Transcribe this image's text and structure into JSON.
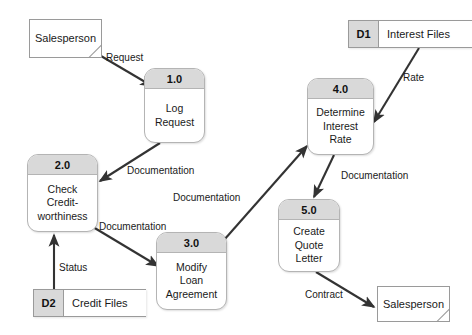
{
  "diagram": {
    "type": "data-flow-diagram",
    "notation": "Gane-Sarson",
    "colors": {
      "background": "#ffffff",
      "shape_fill": "#ffffff",
      "header_fill": "#d9d9d9",
      "stroke": "#9a9a9a",
      "arrow": "#333333",
      "text": "#1a1a1a"
    },
    "entities": [
      {
        "id": "salesperson-source",
        "label": "Salesperson"
      },
      {
        "id": "salesperson-sink",
        "label": "Salesperson"
      }
    ],
    "processes": [
      {
        "id": "process-1",
        "number": "1.0",
        "lines": [
          "Log",
          "Request"
        ]
      },
      {
        "id": "process-2",
        "number": "2.0",
        "lines": [
          "Check",
          "Credit-",
          "worthiness"
        ]
      },
      {
        "id": "process-3",
        "number": "3.0",
        "lines": [
          "Modify",
          "Loan",
          "Agreement"
        ]
      },
      {
        "id": "process-4",
        "number": "4.0",
        "lines": [
          "Determine",
          "Interest",
          "Rate"
        ]
      },
      {
        "id": "process-5",
        "number": "5.0",
        "lines": [
          "Create",
          "Quote",
          "Letter"
        ]
      }
    ],
    "datastores": [
      {
        "id": "store-d1",
        "code": "D1",
        "label": "Interest Files"
      },
      {
        "id": "store-d2",
        "code": "D2",
        "label": "Credit Files"
      }
    ],
    "flows": [
      {
        "id": "flow-request",
        "label": "Request",
        "from": "salesperson-source",
        "to": "process-1"
      },
      {
        "id": "flow-doc-1-2",
        "label": "Documentation",
        "from": "process-1",
        "to": "process-2"
      },
      {
        "id": "flow-doc-2-3",
        "label": "Documentation",
        "from": "process-2",
        "to": "process-3"
      },
      {
        "id": "flow-doc-3-4",
        "label": "Documentation",
        "from": "process-3",
        "to": "process-4"
      },
      {
        "id": "flow-doc-4-5",
        "label": "Documentation",
        "from": "process-4",
        "to": "process-5"
      },
      {
        "id": "flow-rate",
        "label": "Rate",
        "from": "store-d1",
        "to": "process-4"
      },
      {
        "id": "flow-status",
        "label": "Status",
        "from": "store-d2",
        "to": "process-2"
      },
      {
        "id": "flow-contract",
        "label": "Contract",
        "from": "process-5",
        "to": "salesperson-sink"
      }
    ]
  }
}
